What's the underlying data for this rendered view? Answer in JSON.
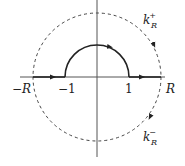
{
  "diagram": {
    "type": "contour-integration",
    "axis_labels": {
      "neg_R": "−R",
      "neg_one": "−1",
      "one": "1",
      "R": "R"
    },
    "arc_labels": {
      "upper": {
        "base": "k",
        "sub": "R",
        "sup": "+"
      },
      "lower": {
        "base": "k",
        "sub": "R",
        "sup": "−"
      }
    },
    "colors": {
      "line": "#222222",
      "axis": "#555555",
      "dashed": "#444444"
    }
  }
}
